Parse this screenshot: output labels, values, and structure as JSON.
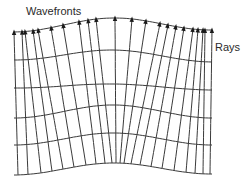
{
  "labels": {
    "wavefronts": "Wavefronts",
    "rays": "Rays"
  },
  "colors": {
    "line": "#3a3a3a",
    "background": "#ffffff",
    "text": "#2a2a2a"
  },
  "diagram": {
    "ray_count": 22,
    "wavefront_count": 6,
    "rays_bottom_x": [
      18,
      28,
      41,
      52,
      63,
      74,
      86,
      96,
      105,
      112,
      116,
      120,
      124,
      131,
      140,
      151,
      162,
      174,
      186,
      195,
      203,
      210
    ],
    "rays_top_x": [
      14,
      22,
      25,
      33,
      38,
      51,
      63,
      79,
      88,
      96,
      115,
      132,
      146,
      160,
      168,
      176,
      184,
      193,
      198,
      203,
      205,
      212
    ],
    "wavefront_levels": [
      {
        "left": 32,
        "mid": 18,
        "right": 30
      },
      {
        "left": 60,
        "mid": 50,
        "right": 62
      },
      {
        "left": 88,
        "mid": 84,
        "right": 90
      },
      {
        "left": 118,
        "mid": 105,
        "right": 118
      },
      {
        "left": 145,
        "mid": 133,
        "right": 145
      },
      {
        "left": 175,
        "mid": 163,
        "right": 174
      }
    ]
  }
}
